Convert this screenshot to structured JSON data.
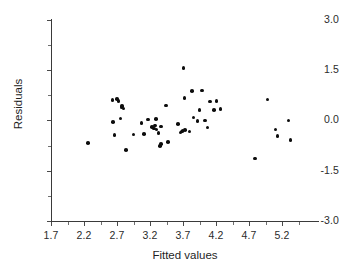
{
  "chart_data": {
    "type": "scatter",
    "title": "",
    "xlabel": "Fitted values",
    "ylabel": "Residuals",
    "xlim": [
      1.7,
      5.75
    ],
    "ylim": [
      -3.0,
      3.0
    ],
    "grid": false,
    "legend": null,
    "xticks": [
      1.7,
      2.2,
      2.7,
      3.2,
      3.7,
      4.2,
      4.7,
      5.2
    ],
    "xtick_labels": [
      "1.7",
      "2.2",
      "2.7",
      "3.2",
      "3.7",
      "4.2",
      "4.7",
      "5.2"
    ],
    "yticks": [
      -3.0,
      -1.5,
      0.0,
      1.5,
      3.0
    ],
    "ytick_labels": [
      "-3.0",
      "-1.5",
      "0.0",
      "1.5",
      "3.0"
    ],
    "marker": "filled-circle",
    "marker_color": "#0d0d0d",
    "axis_color": "#3a3a3a",
    "background": "#ffffff",
    "n_points": 51,
    "points": [
      {
        "x": 2.26,
        "y": -0.68
      },
      {
        "x": 2.63,
        "y": 0.6
      },
      {
        "x": 2.64,
        "y": -0.05
      },
      {
        "x": 2.66,
        "y": -0.44
      },
      {
        "x": 2.7,
        "y": 0.64
      },
      {
        "x": 2.72,
        "y": 0.57
      },
      {
        "x": 2.75,
        "y": 0.05
      },
      {
        "x": 2.77,
        "y": 0.38
      },
      {
        "x": 2.78,
        "y": 0.42
      },
      {
        "x": 2.8,
        "y": 0.35
      },
      {
        "x": 2.84,
        "y": -0.89
      },
      {
        "x": 2.95,
        "y": -0.42
      },
      {
        "x": 3.07,
        "y": -0.08
      },
      {
        "x": 3.11,
        "y": -0.4
      },
      {
        "x": 3.17,
        "y": 0.02
      },
      {
        "x": 3.23,
        "y": -0.2
      },
      {
        "x": 3.26,
        "y": -0.24
      },
      {
        "x": 3.28,
        "y": -0.16
      },
      {
        "x": 3.29,
        "y": 0.03
      },
      {
        "x": 3.3,
        "y": -0.27
      },
      {
        "x": 3.33,
        "y": -0.38
      },
      {
        "x": 3.35,
        "y": -0.76
      },
      {
        "x": 3.37,
        "y": -0.71
      },
      {
        "x": 3.44,
        "y": 0.44
      },
      {
        "x": 3.47,
        "y": -0.64
      },
      {
        "x": 3.62,
        "y": -0.11
      },
      {
        "x": 3.66,
        "y": -0.36
      },
      {
        "x": 3.68,
        "y": -0.33
      },
      {
        "x": 3.69,
        "y": -0.31
      },
      {
        "x": 3.71,
        "y": 1.55
      },
      {
        "x": 3.72,
        "y": 0.66
      },
      {
        "x": 3.73,
        "y": -0.29
      },
      {
        "x": 3.8,
        "y": -0.33
      },
      {
        "x": 3.84,
        "y": 0.88
      },
      {
        "x": 3.86,
        "y": 0.08
      },
      {
        "x": 3.92,
        "y": -0.02
      },
      {
        "x": 3.95,
        "y": 0.31
      },
      {
        "x": 3.99,
        "y": 0.89
      },
      {
        "x": 4.03,
        "y": -0.01
      },
      {
        "x": 4.07,
        "y": -0.22
      },
      {
        "x": 4.11,
        "y": 0.56
      },
      {
        "x": 4.17,
        "y": 0.31
      },
      {
        "x": 4.21,
        "y": 0.58
      },
      {
        "x": 4.27,
        "y": 0.33
      },
      {
        "x": 4.79,
        "y": -1.14
      },
      {
        "x": 4.98,
        "y": 0.62
      },
      {
        "x": 5.1,
        "y": -0.27
      },
      {
        "x": 5.13,
        "y": -0.47
      },
      {
        "x": 5.3,
        "y": -0.01
      },
      {
        "x": 5.33,
        "y": -0.58
      },
      {
        "x": 3.37,
        "y": -0.18
      }
    ]
  }
}
